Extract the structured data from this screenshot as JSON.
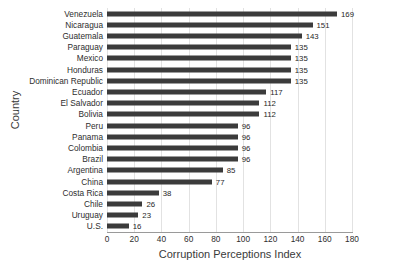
{
  "chart_data": {
    "type": "bar",
    "orientation": "horizontal",
    "title": "",
    "xlabel": "Corruption Perceptions Index",
    "ylabel": "Country",
    "xlim": [
      0,
      180
    ],
    "xticks": [
      0,
      20,
      40,
      60,
      80,
      100,
      120,
      140,
      160,
      180
    ],
    "grid": "vertical",
    "legend": "none",
    "bar_color": "#3b3b3b",
    "gridline_color": "#e2e2e2",
    "axis_color": "#9a9a9a",
    "background": "#ffffff",
    "show_value_labels": true,
    "categories": [
      "Venezuela",
      "Nicaragua",
      "Guatemala",
      "Paraguay",
      "Mexico",
      "Honduras",
      "Dominican Republic",
      "Ecuador",
      "El Salvador",
      "Bolivia",
      "Peru",
      "Panama",
      "Colombia",
      "Brazil",
      "Argentina",
      "China",
      "Costa Rica",
      "Chile",
      "Uruguay",
      "U.S."
    ],
    "values": [
      169,
      151,
      143,
      135,
      135,
      135,
      135,
      117,
      112,
      112,
      96,
      96,
      96,
      96,
      85,
      77,
      38,
      26,
      23,
      16
    ],
    "value_labels": [
      "169",
      "151",
      "143",
      "135",
      "135",
      "135",
      "135",
      "117",
      "112",
      "112",
      "96",
      "96",
      "96",
      "96",
      "85",
      "77",
      "38",
      "26",
      "23",
      "16"
    ]
  }
}
